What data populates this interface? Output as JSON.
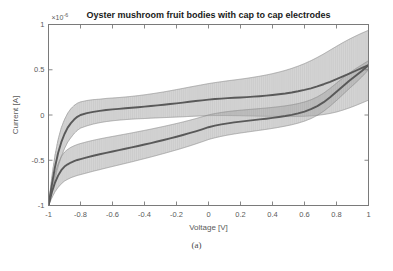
{
  "figure": {
    "caption": "(a)",
    "panel_label": "(a)"
  },
  "chart_data": {
    "type": "line",
    "title": "Oyster mushroom fruit bodies with cap to cap electrodes",
    "xlabel": "Voltage [V]",
    "ylabel": "Current [A]",
    "y_multiplier": "×10",
    "y_multiplier_exponent": "-6",
    "y_multiplier_text": "×10-6",
    "xlim": [
      -1,
      1
    ],
    "ylim": [
      -1,
      1
    ],
    "xticks": [
      -1,
      -0.8,
      -0.6,
      -0.4,
      -0.2,
      0,
      0.2,
      0.4,
      0.6,
      0.8,
      1
    ],
    "xticklabels": [
      "-1",
      "-0.8",
      "-0.6",
      "-0.4",
      "-0.2",
      "0",
      "0.2",
      "0.4",
      "0.6",
      "0.8",
      "1"
    ],
    "yticks": [
      -1,
      -0.5,
      0,
      0.5,
      1
    ],
    "yticklabels": [
      "-1",
      "-0.5",
      "0",
      "0.5",
      "1"
    ],
    "grid": false,
    "legend": "none",
    "colors": {
      "line": "#595959",
      "errorbar": "#a8a8a8",
      "errorbar_cap": "#8c8c8c",
      "axis": "#7a7a7a",
      "title": "#1a1a1a",
      "tick_label": "#5a5a5a"
    },
    "series": [
      {
        "name": "forward sweep (upper branch)",
        "x": [
          -1.0,
          -0.98,
          -0.96,
          -0.94,
          -0.92,
          -0.9,
          -0.88,
          -0.86,
          -0.84,
          -0.82,
          -0.8,
          -0.76,
          -0.72,
          -0.68,
          -0.64,
          -0.6,
          -0.56,
          -0.52,
          -0.48,
          -0.44,
          -0.4,
          -0.36,
          -0.32,
          -0.28,
          -0.24,
          -0.2,
          -0.16,
          -0.12,
          -0.08,
          -0.04,
          0.0,
          0.04,
          0.08,
          0.12,
          0.16,
          0.2,
          0.24,
          0.28,
          0.32,
          0.36,
          0.4,
          0.44,
          0.48,
          0.52,
          0.56,
          0.6,
          0.64,
          0.68,
          0.72,
          0.76,
          0.8,
          0.84,
          0.88,
          0.92,
          0.96,
          1.0
        ],
        "y": [
          -1.0,
          -0.78,
          -0.58,
          -0.42,
          -0.3,
          -0.21,
          -0.14,
          -0.09,
          -0.05,
          -0.02,
          0.0,
          0.02,
          0.035,
          0.045,
          0.055,
          0.062,
          0.068,
          0.074,
          0.08,
          0.086,
          0.092,
          0.099,
          0.106,
          0.113,
          0.121,
          0.129,
          0.137,
          0.146,
          0.154,
          0.162,
          0.17,
          0.176,
          0.181,
          0.186,
          0.19,
          0.194,
          0.198,
          0.203,
          0.208,
          0.214,
          0.221,
          0.229,
          0.238,
          0.249,
          0.262,
          0.277,
          0.295,
          0.316,
          0.34,
          0.367,
          0.396,
          0.427,
          0.458,
          0.489,
          0.52,
          0.55
        ],
        "yerr": [
          0.0,
          0.09,
          0.13,
          0.15,
          0.16,
          0.16,
          0.16,
          0.16,
          0.155,
          0.15,
          0.145,
          0.14,
          0.135,
          0.13,
          0.128,
          0.126,
          0.125,
          0.125,
          0.126,
          0.128,
          0.131,
          0.134,
          0.138,
          0.142,
          0.147,
          0.152,
          0.157,
          0.162,
          0.167,
          0.172,
          0.177,
          0.182,
          0.187,
          0.192,
          0.197,
          0.202,
          0.208,
          0.214,
          0.221,
          0.228,
          0.236,
          0.245,
          0.255,
          0.266,
          0.278,
          0.291,
          0.305,
          0.32,
          0.335,
          0.35,
          0.363,
          0.373,
          0.38,
          0.384,
          0.386,
          0.386
        ]
      },
      {
        "name": "reverse sweep (lower branch)",
        "x": [
          -1.0,
          -0.98,
          -0.96,
          -0.94,
          -0.92,
          -0.9,
          -0.88,
          -0.86,
          -0.84,
          -0.82,
          -0.8,
          -0.76,
          -0.72,
          -0.68,
          -0.64,
          -0.6,
          -0.56,
          -0.52,
          -0.48,
          -0.44,
          -0.4,
          -0.36,
          -0.32,
          -0.28,
          -0.24,
          -0.2,
          -0.16,
          -0.12,
          -0.08,
          -0.04,
          0.0,
          0.04,
          0.08,
          0.12,
          0.16,
          0.2,
          0.24,
          0.28,
          0.32,
          0.36,
          0.4,
          0.44,
          0.48,
          0.52,
          0.56,
          0.6,
          0.64,
          0.68,
          0.72,
          0.76,
          0.8,
          0.84,
          0.88,
          0.92,
          0.96,
          1.0
        ],
        "y": [
          -1.0,
          -0.86,
          -0.75,
          -0.67,
          -0.61,
          -0.57,
          -0.545,
          -0.525,
          -0.51,
          -0.497,
          -0.487,
          -0.468,
          -0.45,
          -0.434,
          -0.418,
          -0.403,
          -0.388,
          -0.373,
          -0.358,
          -0.342,
          -0.326,
          -0.31,
          -0.293,
          -0.276,
          -0.258,
          -0.24,
          -0.221,
          -0.201,
          -0.18,
          -0.158,
          -0.135,
          -0.118,
          -0.104,
          -0.092,
          -0.082,
          -0.073,
          -0.065,
          -0.057,
          -0.049,
          -0.041,
          -0.032,
          -0.022,
          -0.011,
          0.002,
          0.018,
          0.038,
          0.064,
          0.098,
          0.142,
          0.196,
          0.256,
          0.318,
          0.378,
          0.434,
          0.49,
          0.55
        ],
        "yerr": [
          0.0,
          0.06,
          0.1,
          0.13,
          0.15,
          0.16,
          0.165,
          0.168,
          0.17,
          0.171,
          0.172,
          0.172,
          0.171,
          0.17,
          0.168,
          0.166,
          0.164,
          0.162,
          0.16,
          0.158,
          0.156,
          0.154,
          0.152,
          0.15,
          0.148,
          0.146,
          0.144,
          0.142,
          0.14,
          0.138,
          0.136,
          0.134,
          0.132,
          0.13,
          0.128,
          0.126,
          0.124,
          0.122,
          0.12,
          0.118,
          0.116,
          0.114,
          0.112,
          0.11,
          0.108,
          0.106,
          0.104,
          0.102,
          0.1,
          0.098,
          0.096,
          0.092,
          0.086,
          0.078,
          0.066,
          0.05
        ]
      }
    ]
  }
}
